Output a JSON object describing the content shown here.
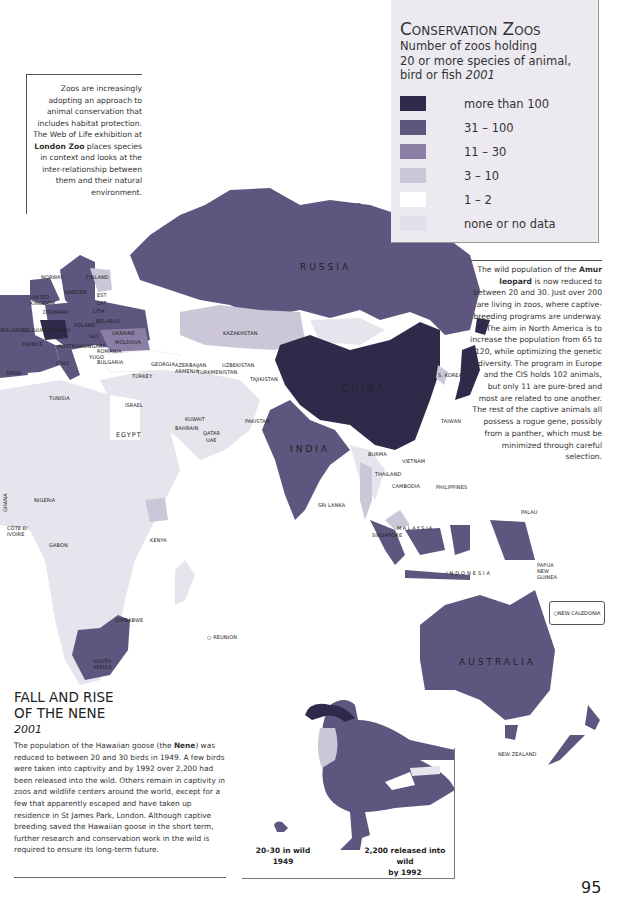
{
  "legend": {
    "title": "Conservation Zoos",
    "subtitle_line1": "Number of zoos holding",
    "subtitle_line2": "20 or more species of animal,",
    "subtitle_line3": "bird or fish",
    "year": "2001",
    "items": [
      {
        "label": "more than 100",
        "color": "#2e2a4a"
      },
      {
        "label": "31 – 100",
        "color": "#5f5680"
      },
      {
        "label": "11 – 30",
        "color": "#8a80a6"
      },
      {
        "label": "3 – 10",
        "color": "#cbc6d8"
      },
      {
        "label": "1 – 2",
        "color": "#ffffff"
      },
      {
        "label": "none or no data",
        "color": "#e6e4ec"
      }
    ]
  },
  "note_left": {
    "part1": "Zoos are increasingly adopting an approach to animal conservation that includes habitat protection. The Web of Life exhibition at ",
    "bold": "London Zoo",
    "part2": " places species in context and looks at the inter-relationship between them and their natural environment."
  },
  "note_right": {
    "part1": "The wild population of the ",
    "bold": "Amur leopard",
    "part2": " is now reduced to between 20 and 30. Just over 200 are living in zoos, where captive-breeding programs are underway. The aim in North America is to increase the population from 65 to 120, while optimizing the genetic diversity. The program in Europe and the CIS holds 102 animals, but only 11 are pure-bred and most are related to one another. The rest of the captive animals all possess a rogue gene, possibly from a panther, which must be minimized through careful selection."
  },
  "nene": {
    "title_line1": "FALL AND RISE",
    "title_line2": "OF THE NENE",
    "year": "2001",
    "text_part1": "The population of the Hawaiian goose (the ",
    "text_bold": "Nene",
    "text_part2": ") was reduced to between 20 and 30 birds in 1949. A few birds were taken into captivity and by 1992 over 2,200 had been released into the wild. Others remain in captivity in zoos and wildlife centers around the world, except for a few that apparently escaped and have taken up residence in St James Park, London. Although captive breeding saved the Hawaiian goose in the short term, further research and conservation work in the wild is required to ensure its long-term future.",
    "caption_small_1": "20–30 in wild",
    "caption_small_2": "1949",
    "caption_big_1": "2,200 released into wild",
    "caption_big_2": "by 1992"
  },
  "page_number": "95",
  "map_labels": {
    "russia": "RUSSIA",
    "china": "CHINA",
    "india": "INDIA",
    "australia": "AUSTRALIA",
    "kazakhstan": "KAZAKHSTAN",
    "uzbekistan": "UZBEKISTAN",
    "turkmenistan": "TURKMENISTAN",
    "tajikistan": "TAJIKISTAN",
    "azerbaijan": "AZERBAIJAN",
    "armenia": "ARMENIA",
    "georgia": "GEORGIA",
    "turkey": "TURKEY",
    "norway": "NORWAY",
    "finland": "FINLAND",
    "sweden": "SWEDEN",
    "uk": "UNITED KINGDOM",
    "denmark": "DENMARK",
    "est": "EST",
    "lat": "LAT",
    "lith": "LITH",
    "belarus": "BELARUS",
    "poland": "POLAND",
    "germany": "GERMANY",
    "ukraine": "UKRAINE",
    "moldova": "MOLDOVA",
    "france": "FRANCE",
    "ireland": "IRELAND",
    "belgium": "BELGIUM",
    "czech": "CZECH REP.",
    "slo": "SLO",
    "austria": "AUSTRIA",
    "hungary": "HUNGARY",
    "romania": "ROMANIA",
    "yugo": "YUGO",
    "bulgaria": "BULGARIA",
    "italy": "ITALY",
    "spain": "SPAIN",
    "tunisia": "TUNISIA",
    "israel": "ISRAEL",
    "egypt": "EGYPT",
    "kuwait": "KUWAIT",
    "bahrain": "BAHRAIN",
    "qatar": "QATAR",
    "uae": "UAE",
    "pakistan": "PAKISTAN",
    "nigeria": "NIGERIA",
    "ghana": "GHANA",
    "cote": "CÔTE D' IVOIRE",
    "gabon": "GABON",
    "kenya": "KENYA",
    "zimbabwe": "ZIMBABWE",
    "south_africa": "SOUTH AFRICA",
    "reunion": "REUNION",
    "burma": "BURMA",
    "thailand": "THAILAND",
    "cambodia": "CAMBODIA",
    "vietnam": "VIETNAM",
    "sri_lanka": "SRI LANKA",
    "philippines": "PHILIPPINES",
    "taiwan": "TAIWAN",
    "s_korea": "S. KOREA",
    "malaysia": "MALAYSIA",
    "singapore": "SINGAPORE",
    "indonesia": "INDONESIA",
    "papua": "PAPUA NEW GUINEA",
    "palau": "PALAU",
    "new_caledonia": "NEW CALEDONIA",
    "new_zealand": "NEW ZEALAND"
  }
}
